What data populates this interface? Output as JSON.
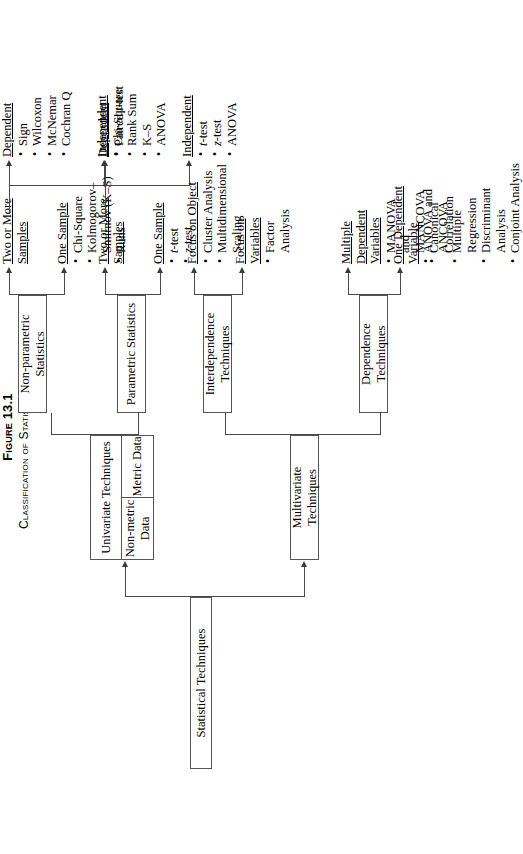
{
  "figure": {
    "number": "Figure 13.1",
    "caption": "Classification of Statistical Techniques"
  },
  "nodes": {
    "root": "Statistical Techniques",
    "univariate": "Univariate Techniques",
    "metric_data": "Metric Data",
    "nonmetric_data": "Non-metric Data",
    "multivariate": "Multivariate Techniques",
    "nonparametric": "Non-parametric Statistics",
    "parametric": "Parametric Statistics",
    "dependence": "Dependence Techniques",
    "interdependence": "Interdependence Techniques"
  },
  "leaves": {
    "np_one_sample": {
      "header": "One Sample",
      "items": [
        "Chi-Square",
        "Kolmogorov–Smirnov (K–S)",
        "Runs"
      ]
    },
    "np_two_or_more": {
      "header": "Two or More Samples",
      "dependent": {
        "header": "Dependent",
        "items": [
          "Sign",
          "Wilcoxon",
          "McNemar",
          "Cochran Q"
        ]
      },
      "independent": {
        "header": "Independent",
        "items": [
          "Chi-Square",
          "Rank Sum",
          "K–S",
          "ANOVA"
        ]
      }
    },
    "p_one_sample": {
      "header": "One Sample",
      "items": [
        "t-test",
        "z-test"
      ]
    },
    "p_two_or_more": {
      "header": "Two or More Samples",
      "dependent": {
        "header": "Dependent",
        "items": [
          "Paired t-test"
        ]
      },
      "independent": {
        "header": "Independent",
        "items": [
          "t-test",
          "z-test",
          "ANOVA"
        ]
      }
    },
    "dep_one_dv": {
      "header": "One Dependent Variable",
      "items": [
        "ANOVA and ANCOVA",
        "Multiple Regression",
        "Discriminant Analysis",
        "Conjoint Analysis"
      ]
    },
    "dep_multi_dv": {
      "header": "Multiple Dependent Variables",
      "items": [
        "MANOVA and MANCOVA",
        "Canonical Correlation"
      ]
    },
    "inter_focus_variables": {
      "header": "Focus on Variables",
      "items": [
        "Factor Analysis"
      ]
    },
    "inter_focus_object": {
      "header": "Focus on Object",
      "items": [
        "Cluster Analysis",
        "Multidimensional Scaling"
      ]
    }
  },
  "colors": {
    "box_border": "#555555",
    "line": "#4a4a4a",
    "text": "#000000",
    "background": "#ffffff"
  }
}
